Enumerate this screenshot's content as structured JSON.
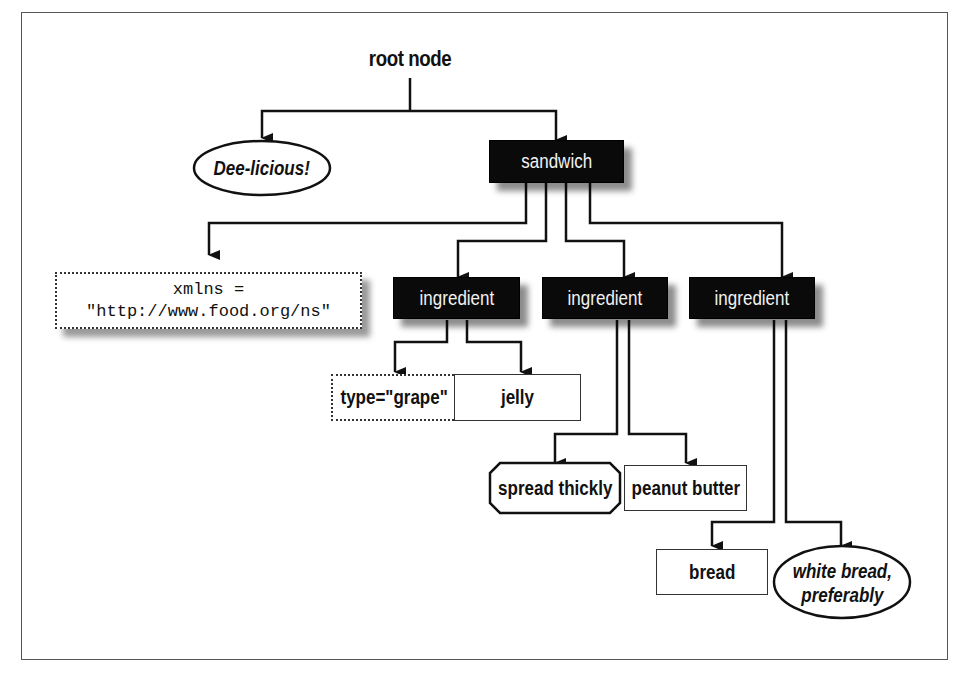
{
  "diagram": {
    "root_label": "root node",
    "nodes": {
      "comment_root": {
        "label": "Dee-licious!",
        "kind": "comment",
        "shape": "ellipse"
      },
      "sandwich": {
        "label": "sandwich",
        "kind": "element",
        "shape": "shadowed-black-box"
      },
      "xmlns_attr": {
        "line1": "xmlns =",
        "line2": "\"http://www.food.org/ns\"",
        "kind": "namespace",
        "shape": "dotted-box"
      },
      "ingredient_1": {
        "label": "ingredient",
        "kind": "element",
        "shape": "shadowed-black-box"
      },
      "ingredient_2": {
        "label": "ingredient",
        "kind": "element",
        "shape": "shadowed-black-box"
      },
      "ingredient_3": {
        "label": "ingredient",
        "kind": "element",
        "shape": "shadowed-black-box"
      },
      "type_attr": {
        "label": "type=\"grape\"",
        "kind": "attribute",
        "shape": "dotted-box"
      },
      "jelly": {
        "label": "jelly",
        "kind": "text",
        "shape": "box"
      },
      "spread_pi": {
        "label": "spread thickly",
        "kind": "processing-instruction",
        "shape": "octagon"
      },
      "peanut_butter": {
        "label": "peanut butter",
        "kind": "text",
        "shape": "box"
      },
      "bread": {
        "label": "bread",
        "kind": "text",
        "shape": "box"
      },
      "white_bread_comment": {
        "line1": "white bread,",
        "line2": "preferably",
        "kind": "comment",
        "shape": "ellipse"
      }
    },
    "edges": [
      [
        "root node",
        "Dee-licious!"
      ],
      [
        "root node",
        "sandwich"
      ],
      [
        "sandwich",
        "xmlns"
      ],
      [
        "sandwich",
        "ingredient_1"
      ],
      [
        "sandwich",
        "ingredient_2"
      ],
      [
        "sandwich",
        "ingredient_3"
      ],
      [
        "ingredient_1",
        "type=\"grape\""
      ],
      [
        "ingredient_1",
        "jelly"
      ],
      [
        "ingredient_2",
        "spread thickly"
      ],
      [
        "ingredient_2",
        "peanut butter"
      ],
      [
        "ingredient_3",
        "bread"
      ],
      [
        "ingredient_3",
        "white bread, preferably"
      ]
    ],
    "colors": {
      "element_fill": "#0a0a0a",
      "element_text": "#f2f2f2",
      "line": "#111111",
      "background": "#ffffff"
    }
  }
}
